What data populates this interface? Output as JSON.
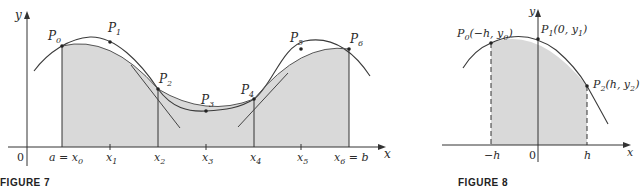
{
  "figure7": {
    "caption": "FIGURE 7",
    "axis": {
      "y_label": "y",
      "x_label": "x",
      "origin_label": "0"
    },
    "tick_labels": [
      {
        "main": "a = x",
        "sub": "0"
      },
      {
        "main": "x",
        "sub": "1"
      },
      {
        "main": "x",
        "sub": "2"
      },
      {
        "main": "x",
        "sub": "3"
      },
      {
        "main": "x",
        "sub": "4"
      },
      {
        "main": "x",
        "sub": "5"
      },
      {
        "main": "x",
        "sub": "6",
        "suffix": " = b"
      }
    ],
    "points": [
      {
        "main": "P",
        "sub": "0"
      },
      {
        "main": "P",
        "sub": "1"
      },
      {
        "main": "P",
        "sub": "2"
      },
      {
        "main": "P",
        "sub": "3"
      },
      {
        "main": "P",
        "sub": "4"
      },
      {
        "main": "P",
        "sub": "5"
      },
      {
        "main": "P",
        "sub": "6"
      }
    ]
  },
  "figure8": {
    "caption": "FIGURE 8",
    "axis": {
      "y_label": "y",
      "x_label": "x",
      "origin_label": "0"
    },
    "tick_labels": {
      "neg_h": "−h",
      "h": "h"
    },
    "points": [
      {
        "main": "P",
        "sub": "0",
        "coords": "(−h, y",
        "coords_sub": "0",
        "close": ")"
      },
      {
        "main": "P",
        "sub": "1",
        "coords": "(0, y",
        "coords_sub": "1",
        "close": ")"
      },
      {
        "main": "P",
        "sub": "2",
        "coords": "(h, y",
        "coords_sub": "2",
        "close": ")"
      }
    ]
  },
  "colors": {
    "shade": "#d9d9d9",
    "curve": "#3a3a3a",
    "axis": "#333333"
  }
}
